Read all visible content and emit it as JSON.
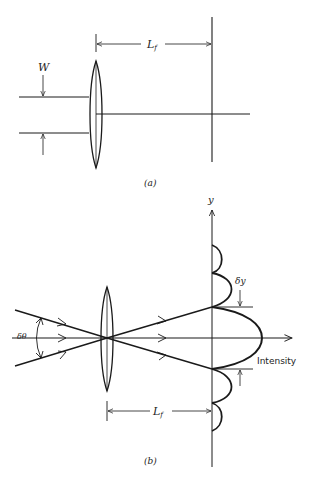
{
  "figure_a": {
    "caption": "(a)",
    "beam_width_label": "W",
    "focal_length_label": "L",
    "focal_length_subscript": "f"
  },
  "figure_b": {
    "caption": "(b)",
    "y_axis_label": "y",
    "angle_label": "δθ",
    "spot_label": "δy",
    "intensity_label": "Intensity",
    "focal_length_label": "L",
    "focal_length_subscript": "f"
  },
  "colors": {
    "line": "#1a1a1a",
    "background": "#ffffff"
  }
}
